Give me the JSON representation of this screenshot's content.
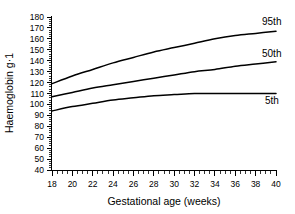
{
  "chart_data": {
    "type": "line",
    "title": "",
    "xlabel": "Gestational age (weeks)",
    "ylabel": "Haemoglobin g·1",
    "xlim": [
      18,
      40
    ],
    "ylim": [
      40,
      180
    ],
    "grid": false,
    "legend_position": "inline-right",
    "x_ticks": [
      18,
      20,
      22,
      24,
      26,
      28,
      30,
      32,
      34,
      36,
      38,
      40
    ],
    "y_ticks": [
      40,
      50,
      60,
      70,
      80,
      90,
      100,
      110,
      120,
      130,
      140,
      150,
      160,
      170,
      180
    ],
    "x_minor_tick_step": 0.5,
    "y_minor_tick_step": 2,
    "x": [
      18,
      20,
      22,
      24,
      26,
      28,
      30,
      32,
      34,
      36,
      38,
      40
    ],
    "series": [
      {
        "name": "95th",
        "label": "95th",
        "color": "#000000",
        "values": [
          119,
          126,
          132,
          138,
          143,
          148,
          152,
          156,
          160,
          163,
          165,
          167
        ]
      },
      {
        "name": "50th",
        "label": "50th",
        "color": "#000000",
        "values": [
          107,
          111,
          115,
          118,
          121,
          124,
          127,
          130,
          132,
          135,
          137,
          139
        ]
      },
      {
        "name": "5th",
        "label": "5th",
        "color": "#000000",
        "values": [
          94,
          98,
          101,
          104,
          106,
          108,
          109,
          110,
          110,
          110,
          110,
          110
        ]
      }
    ]
  },
  "axes": {
    "x_title": "Gestational age (weeks)",
    "y_title": "Haemoglobin g·1",
    "x_tick_labels": [
      "18",
      "20",
      "22",
      "24",
      "26",
      "28",
      "30",
      "32",
      "34",
      "36",
      "38",
      "40"
    ],
    "y_tick_labels": [
      "180",
      "170",
      "160",
      "150",
      "140",
      "130",
      "120",
      "110",
      "100",
      "90",
      "80",
      "70",
      "60",
      "50",
      "40"
    ]
  },
  "series_labels": {
    "p95": "95th",
    "p50": "50th",
    "p5": "5th"
  }
}
